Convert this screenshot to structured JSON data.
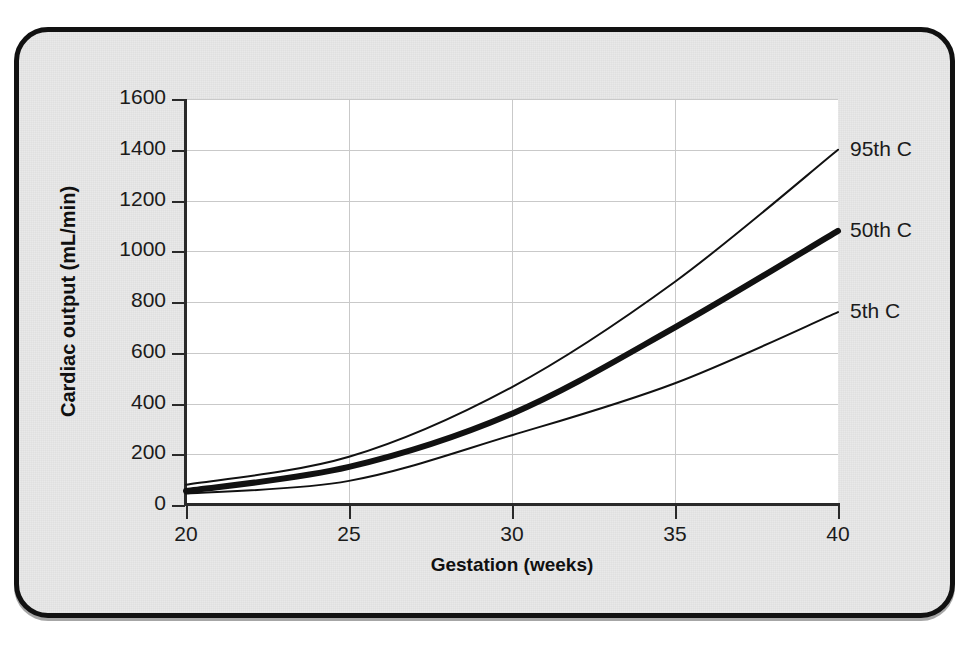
{
  "figure": {
    "clipped_heading": "",
    "panel_background": "#e9e9e9",
    "panel_border_color": "#111111",
    "plot_background": "#ffffff",
    "gridline_color": "#c9c9c9",
    "axis_color": "#2a2a2a",
    "curve_color": "#111111"
  },
  "chart_data": {
    "type": "line",
    "title": "",
    "subtitle": "",
    "xlabel": "Gestation (weeks)",
    "ylabel": "Cardiac output (mL/min)",
    "xlim": [
      20,
      40
    ],
    "ylim": [
      0,
      1600
    ],
    "xticks": [
      20,
      25,
      30,
      35,
      40
    ],
    "xtick_labels": [
      "20",
      "25",
      "30",
      "35",
      "40"
    ],
    "yticks": [
      0,
      200,
      400,
      600,
      800,
      1000,
      1200,
      1400,
      1600
    ],
    "ytick_labels": [
      "0",
      "200",
      "400",
      "600",
      "800",
      "1000",
      "1200",
      "1400",
      "1600"
    ],
    "grid": true,
    "grid_axis": "both",
    "legend_position": "right-of-plot-inline",
    "x": [
      20,
      25,
      30,
      35,
      40
    ],
    "series": [
      {
        "name": "95th C",
        "label": "95th C",
        "values": [
          80,
          190,
          465,
          880,
          1400
        ],
        "linewidth": "thin",
        "color": "#111111"
      },
      {
        "name": "50th C",
        "label": "50th C",
        "values": [
          55,
          150,
          360,
          700,
          1080
        ],
        "linewidth": "thick",
        "color": "#111111"
      },
      {
        "name": "5th C",
        "label": "5th C",
        "values": [
          45,
          95,
          275,
          480,
          760
        ],
        "linewidth": "thin",
        "color": "#111111"
      }
    ],
    "annotations": [
      {
        "text": "95th C",
        "x": 40,
        "y": 1400,
        "placement": "right"
      },
      {
        "text": "50th C",
        "x": 40,
        "y": 1080,
        "placement": "right"
      },
      {
        "text": "5th C",
        "x": 40,
        "y": 760,
        "placement": "right"
      }
    ]
  }
}
